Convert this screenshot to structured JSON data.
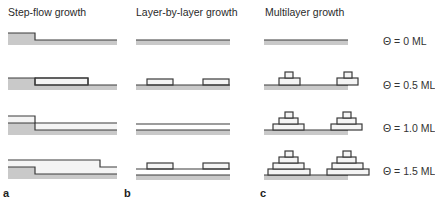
{
  "figure": {
    "columns": [
      {
        "id": "a",
        "title": "Step-flow growth",
        "letter": "a",
        "title_x": 8,
        "letter_x": 3
      },
      {
        "id": "b",
        "title": "Layer-by-layer growth",
        "letter": "b",
        "title_x": 136,
        "letter_x": 124
      },
      {
        "id": "c",
        "title": "Multilayer growth",
        "letter": "c",
        "title_x": 265,
        "letter_x": 260
      }
    ],
    "coverage_labels": [
      {
        "text": "Θ = 0 ML",
        "y": 35
      },
      {
        "text": "Θ = 0.5 ML",
        "y": 79
      },
      {
        "text": "Θ = 1.0 ML",
        "y": 122
      },
      {
        "text": "Θ = 1.5 ML",
        "y": 165
      }
    ],
    "colors": {
      "line": "#3a3a3a",
      "substrate": "#c9c9c9",
      "island_fill": "#f4f4f4",
      "text": "#2a2a2a"
    }
  }
}
